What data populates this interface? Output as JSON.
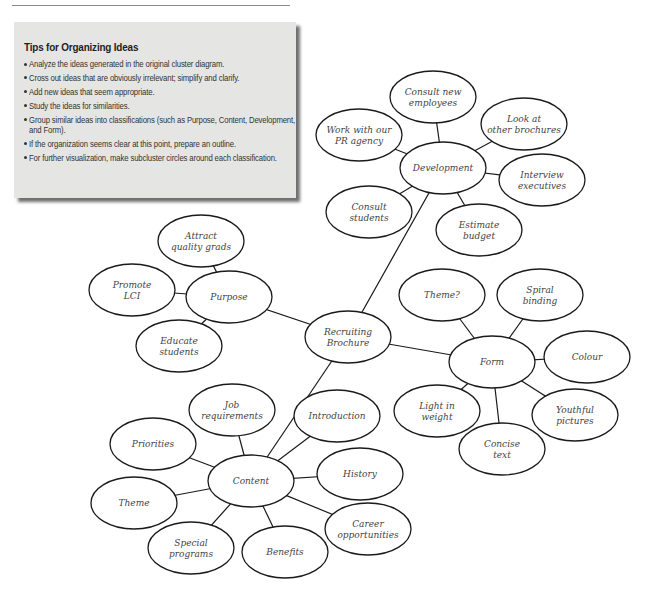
{
  "tips": {
    "title": "Tips for Organizing Ideas",
    "items": [
      "Analyze the ideas generated in the original cluster diagram.",
      "Cross out ideas that are obviously irrelevant; simplify and clarify.",
      "Add new ideas that seem appropriate.",
      "Study the ideas for similarities.",
      "Group similar ideas into classifications (such as Purpose, Content, Development, and Form).",
      "If the organization seems clear at this point, prepare an outline.",
      "For further visualization, make subcluster circles around each classification."
    ]
  },
  "diagram": {
    "center": {
      "id": "recruiting-brochure",
      "lines": [
        "Recruiting",
        "Brochure"
      ],
      "cx": 348,
      "cy": 337
    },
    "nodes": [
      {
        "id": "development",
        "lines": [
          "Development"
        ],
        "cx": 443,
        "cy": 168,
        "parent": "recruiting-brochure"
      },
      {
        "id": "consult-new-employees",
        "lines": [
          "Consult new",
          "employees"
        ],
        "cx": 433,
        "cy": 97,
        "parent": "development"
      },
      {
        "id": "work-with-pr-agency",
        "lines": [
          "Work with our",
          "PR agency"
        ],
        "cx": 359,
        "cy": 135,
        "parent": "development"
      },
      {
        "id": "look-at-other-brochures",
        "lines": [
          "Look at",
          "other brochures"
        ],
        "cx": 524,
        "cy": 124,
        "parent": "development"
      },
      {
        "id": "interview-executives",
        "lines": [
          "Interview",
          "executives"
        ],
        "cx": 542,
        "cy": 180,
        "parent": "development"
      },
      {
        "id": "consult-students",
        "lines": [
          "Consult",
          "students"
        ],
        "cx": 369,
        "cy": 212,
        "parent": "development"
      },
      {
        "id": "estimate-budget",
        "lines": [
          "Estimate",
          "budget"
        ],
        "cx": 479,
        "cy": 230,
        "parent": "development"
      },
      {
        "id": "purpose",
        "lines": [
          "Purpose"
        ],
        "cx": 229,
        "cy": 297,
        "parent": "recruiting-brochure"
      },
      {
        "id": "attract-quality-grads",
        "lines": [
          "Attract",
          "quality grads"
        ],
        "cx": 201,
        "cy": 241,
        "parent": "purpose"
      },
      {
        "id": "promote-lci",
        "lines": [
          "Promote",
          "LCI"
        ],
        "cx": 132,
        "cy": 290,
        "parent": "purpose"
      },
      {
        "id": "educate-students",
        "lines": [
          "Educate",
          "students"
        ],
        "cx": 179,
        "cy": 346,
        "parent": "purpose"
      },
      {
        "id": "form",
        "lines": [
          "Form"
        ],
        "cx": 492,
        "cy": 362,
        "parent": "recruiting-brochure"
      },
      {
        "id": "theme-question",
        "lines": [
          "Theme?"
        ],
        "cx": 442,
        "cy": 295,
        "parent": "form"
      },
      {
        "id": "spiral-binding",
        "lines": [
          "Spiral",
          "binding"
        ],
        "cx": 540,
        "cy": 295,
        "parent": "form"
      },
      {
        "id": "colour",
        "lines": [
          "Colour"
        ],
        "cx": 587,
        "cy": 357,
        "parent": "form"
      },
      {
        "id": "light-in-weight",
        "lines": [
          "Light in",
          "weight"
        ],
        "cx": 437,
        "cy": 411,
        "parent": "form"
      },
      {
        "id": "concise-text",
        "lines": [
          "Concise",
          "text"
        ],
        "cx": 502,
        "cy": 449,
        "parent": "form"
      },
      {
        "id": "youthful-pictures",
        "lines": [
          "Youthful",
          "pictures"
        ],
        "cx": 575,
        "cy": 415,
        "parent": "form"
      },
      {
        "id": "content",
        "lines": [
          "Content"
        ],
        "cx": 251,
        "cy": 481,
        "parent": "recruiting-brochure"
      },
      {
        "id": "job-requirements",
        "lines": [
          "Job",
          "requirements"
        ],
        "cx": 232,
        "cy": 410,
        "parent": "content"
      },
      {
        "id": "introduction",
        "lines": [
          "Introduction"
        ],
        "cx": 337,
        "cy": 416,
        "parent": "content"
      },
      {
        "id": "priorities",
        "lines": [
          "Priorities"
        ],
        "cx": 153,
        "cy": 444,
        "parent": "content"
      },
      {
        "id": "history",
        "lines": [
          "History"
        ],
        "cx": 360,
        "cy": 474,
        "parent": "content"
      },
      {
        "id": "theme",
        "lines": [
          "Theme"
        ],
        "cx": 134,
        "cy": 503,
        "parent": "content"
      },
      {
        "id": "career-opportunities",
        "lines": [
          "Career",
          "opportunities"
        ],
        "cx": 368,
        "cy": 529,
        "parent": "content"
      },
      {
        "id": "special-programs",
        "lines": [
          "Special",
          "programs"
        ],
        "cx": 191,
        "cy": 548,
        "parent": "content"
      },
      {
        "id": "benefits",
        "lines": [
          "Benefits"
        ],
        "cx": 285,
        "cy": 552,
        "parent": "content"
      }
    ],
    "rx": 43,
    "ry": 26
  }
}
